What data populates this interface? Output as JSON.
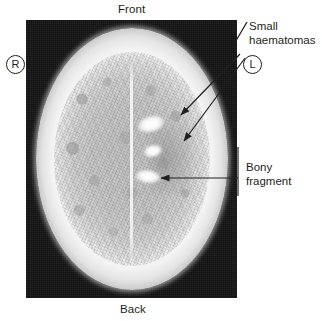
{
  "figure": {
    "type": "annotated-medical-image",
    "modality": "CT head axial slice",
    "background_color": "#ffffff",
    "ink_color": "#231f20"
  },
  "orientation": {
    "front_label": "Front",
    "back_label": "Back",
    "right_marker": "R",
    "left_marker": "L"
  },
  "annotations": [
    {
      "id": "small-haematomas",
      "label_line_1": "Small",
      "label_line_2": "haematomas",
      "text": "Small haematomas",
      "arrow_count": 2,
      "points_to": "hyperdense lesions in left frontoparietal region"
    },
    {
      "id": "bony-fragment",
      "label_line_1": "Bony",
      "label_line_2": "fragment",
      "text": "Bony fragment",
      "arrow_count": 1,
      "points_to": "bright bone density within left hemisphere"
    }
  ],
  "scan": {
    "panel_background": "#141414",
    "skull_color": "#ffffff",
    "brain_color": "#bdbdbd",
    "lesion_color": "#ffffff",
    "midline_structure": "falx cerebri"
  }
}
